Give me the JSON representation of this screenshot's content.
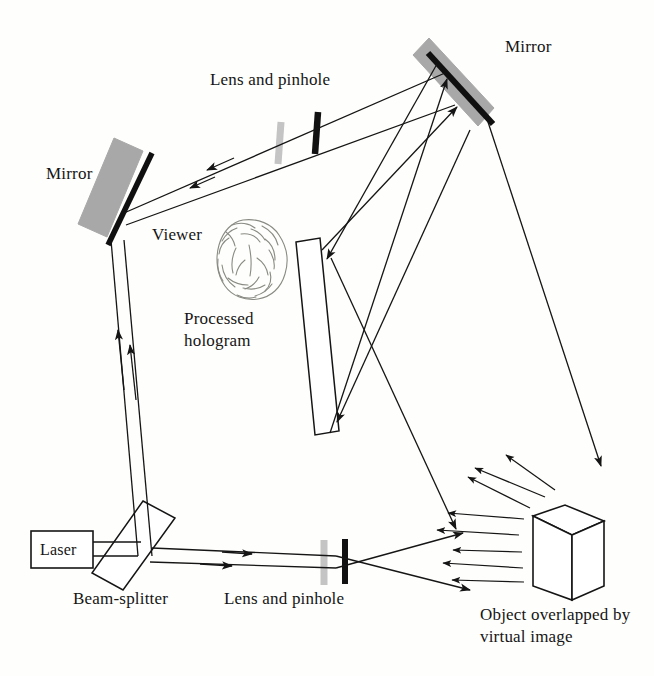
{
  "figure": {
    "background_color": "#fefefc",
    "ink_color": "#151515",
    "mirror_face_color": "#a8a8a8",
    "lens_color": "#c2c2c2",
    "pinhole_color": "#111111",
    "width": 654,
    "height": 676
  },
  "labels": {
    "mirror_top": "Mirror",
    "mirror_left": "Mirror",
    "lens_pinhole_top": "Lens and pinhole",
    "viewer": "Viewer",
    "processed_hologram": "Processed hologram",
    "laser": "Laser",
    "beam_splitter": "Beam-splitter",
    "lens_pinhole_bottom": "Lens and pinhole",
    "object": "Object overlapped by virtual image"
  },
  "components": [
    {
      "name": "laser",
      "type": "source",
      "label": "Laser"
    },
    {
      "name": "beam-splitter",
      "type": "optic",
      "label": "Beam-splitter"
    },
    {
      "name": "mirror-left",
      "type": "mirror",
      "label": "Mirror"
    },
    {
      "name": "mirror-top-right",
      "type": "mirror",
      "label": "Mirror"
    },
    {
      "name": "lens-pinhole-upper",
      "type": "spatial-filter",
      "label": "Lens and pinhole"
    },
    {
      "name": "lens-pinhole-lower",
      "type": "spatial-filter",
      "label": "Lens and pinhole"
    },
    {
      "name": "processed-hologram",
      "type": "plate",
      "label": "Processed hologram"
    },
    {
      "name": "viewer-head",
      "type": "observer",
      "label": "Viewer"
    },
    {
      "name": "object-cube",
      "type": "object",
      "label": "Object overlapped by virtual image"
    }
  ],
  "beams": {
    "laser_to_splitter": "horizontal double-line beam",
    "splitter_to_left_mirror": "upward double-line beam with two arrowheads",
    "left_mirror_to_top_mirror": "double-line beam through upper lens and pinhole, two arrowheads pointing left",
    "top_mirror_to_hologram": "two rays arriving at hologram top and bottom",
    "splitter_to_object": "diverging beam through lower lens and pinhole toward object",
    "object_scatter": "scattered rays radiating from object"
  }
}
